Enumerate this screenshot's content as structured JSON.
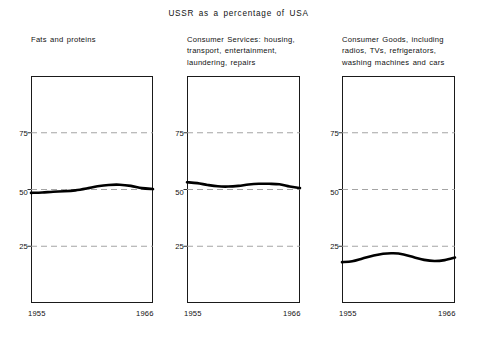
{
  "chart_data": {
    "type": "line",
    "title": "USSR as a percentage of USA",
    "xlabel": "",
    "ylabel": "",
    "xlim": [
      1955,
      1966
    ],
    "ylim": [
      0,
      100
    ],
    "grid": true,
    "gridlines": [
      25,
      50,
      75
    ],
    "legend": "none",
    "x_ticks": [
      "1955",
      "1966"
    ],
    "y_ticks": [
      "25",
      "50",
      "75"
    ],
    "panels": [
      {
        "caption": "Fats and proteins",
        "x": [
          1955,
          1956,
          1957,
          1958,
          1959,
          1960,
          1961,
          1962,
          1963,
          1964,
          1965,
          1966
        ],
        "values": [
          48.5,
          48.7,
          49.0,
          49.2,
          49.6,
          50.4,
          51.4,
          52.0,
          52.1,
          51.6,
          50.6,
          50.2
        ]
      },
      {
        "caption": "Consumer Services: housing,\ntransport, entertainment,\nlaundering, repairs",
        "x": [
          1955,
          1956,
          1957,
          1958,
          1959,
          1960,
          1961,
          1962,
          1963,
          1964,
          1965,
          1966
        ],
        "values": [
          53.2,
          52.8,
          52.0,
          51.4,
          51.3,
          51.6,
          52.2,
          52.5,
          52.5,
          52.3,
          51.3,
          50.6
        ]
      },
      {
        "caption": "Consumer Goods, including\nradios, TVs, refrigerators,\nwashing machines and cars",
        "x": [
          1955,
          1956,
          1957,
          1958,
          1959,
          1960,
          1961,
          1962,
          1963,
          1964,
          1965,
          1966
        ],
        "values": [
          18.0,
          18.4,
          19.6,
          20.8,
          21.7,
          21.9,
          21.4,
          20.2,
          19.0,
          18.5,
          18.9,
          20.0
        ]
      }
    ],
    "colors": {
      "line": "#000000",
      "grid": "#9a9a9a",
      "axis": "#1a1a1a",
      "background": "#ffffff"
    }
  }
}
